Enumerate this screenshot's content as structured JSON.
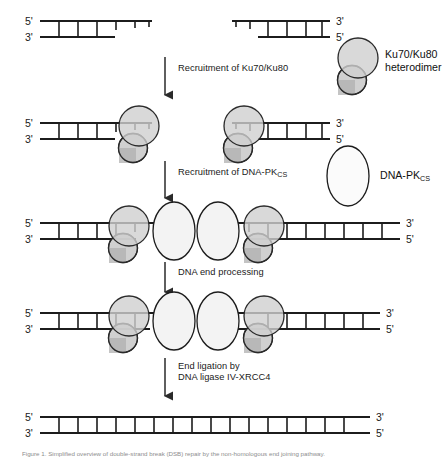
{
  "figure": {
    "width": 443,
    "height": 461,
    "background": "#ffffff"
  },
  "labels": {
    "five_prime": "5'",
    "three_prime": "3'"
  },
  "steps": [
    {
      "id": "step-1-broken-dna",
      "name": "double-strand-break",
      "y": 14,
      "description": "Two DNA fragments with incompatible overhangs"
    },
    {
      "id": "step-2-ku-bound",
      "name": "ku-bound-dna",
      "y": 112,
      "description": "Ku70/Ku80 heterodimers bound at both DNA ends"
    },
    {
      "id": "step-3-dnapk-synapsis",
      "name": "dnapk-synaptic-complex",
      "y": 212,
      "description": "DNA-PKcs recruited, synaptic complex formed"
    },
    {
      "id": "step-4-processed-ends",
      "name": "processed-dna-ends",
      "y": 302,
      "description": "DNA ends processed and aligned"
    },
    {
      "id": "step-5-ligated",
      "name": "ligated-dna",
      "y": 406,
      "description": "Repaired continuous DNA duplex"
    }
  ],
  "arrows": [
    {
      "id": "arrow-1",
      "name": "arrow-recruitment-ku",
      "label_line1": "Recruitment of Ku70/Ku80",
      "label_line2": "",
      "label_x": 178,
      "label_y": 67,
      "x": 165,
      "y_start": 57,
      "y_end": 101
    },
    {
      "id": "arrow-2",
      "name": "arrow-recruitment-dnapk",
      "label_line1": "Recruitment of DNA-PK",
      "label_sub": "CS",
      "label_line2": "",
      "label_x": 178,
      "label_y": 170,
      "x": 165,
      "y_start": 161,
      "y_end": 204
    },
    {
      "id": "arrow-3",
      "name": "arrow-dna-end-processing",
      "label_line1": "DNA end processing",
      "label_line2": "",
      "label_x": 178,
      "label_y": 271,
      "x": 165,
      "y_start": 262,
      "y_end": 296
    },
    {
      "id": "arrow-4",
      "name": "arrow-end-ligation",
      "label_line1": "End ligation by",
      "label_line2": "DNA ligase IV-XRCC4",
      "label_x": 178,
      "label_y": 366,
      "x": 165,
      "y_start": 358,
      "y_end": 399
    }
  ],
  "legend": [
    {
      "id": "legend-ku",
      "name": "legend-ku-heterodimer",
      "label_line1": "Ku70/Ku80",
      "label_line2": "heterodimer",
      "label_x": 385,
      "label_y": 56,
      "glyph": "two-overlapping-circles",
      "fill": "#d4d4d4"
    },
    {
      "id": "legend-dnapk",
      "name": "legend-dna-pkcs",
      "label_line1": "DNA-PK",
      "label_sub": "CS",
      "label_line2": "",
      "label_x": 372,
      "label_y": 172,
      "glyph": "ellipse",
      "fill": "#f4f4f4"
    }
  ],
  "colors": {
    "dna_stroke": "#1c1c1c",
    "ku_fill": "#cfcfcf",
    "ku_fill_dark": "#b4b4b4",
    "ku_stroke": "#2a2a2a",
    "dnapk_fill": "#f5f5f5",
    "dnapk_stroke": "#1c1c1c",
    "arrow": "#2a2a2a",
    "text": "#1a1a1a",
    "caption": "#8d8d8d"
  },
  "caption": {
    "text": "Figure 1. Simplified overview of double-strand break (DSB) repair by the non-homologous end joining pathway."
  }
}
